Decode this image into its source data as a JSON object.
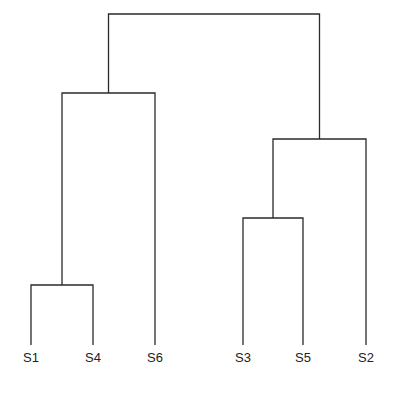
{
  "chart_data": {
    "type": "dendrogram",
    "title": "",
    "leaves": [
      "S1",
      "S4",
      "S6",
      "S3",
      "S5",
      "S2"
    ],
    "leaf_x": [
      31,
      93,
      155,
      243,
      303,
      366
    ],
    "leaf_bottom_y": 345,
    "label_y": 362,
    "merges": [
      {
        "id": "c1",
        "children": [
          "S1",
          "S4"
        ],
        "height_y": 285
      },
      {
        "id": "c2",
        "children": [
          "S3",
          "S5"
        ],
        "height_y": 218
      },
      {
        "id": "c3",
        "children": [
          "c2",
          "S2"
        ],
        "height_y": 139
      },
      {
        "id": "c4",
        "children": [
          "c1",
          "S6"
        ],
        "height_y": 93
      },
      {
        "id": "root",
        "children": [
          "c4",
          "c3"
        ],
        "height_y": 14
      }
    ],
    "axes": "none",
    "grid": false
  },
  "colors": {
    "line": "#2a2a2a",
    "label": "#222222",
    "background": "#ffffff"
  }
}
